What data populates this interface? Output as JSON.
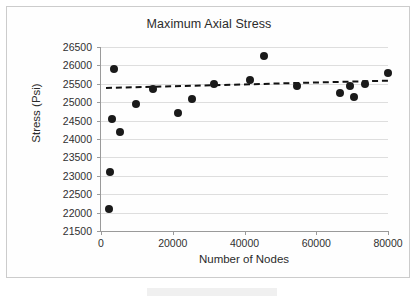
{
  "chart_data": {
    "type": "scatter",
    "title": "Maximum Axial Stress",
    "xlabel": "Number of Nodes",
    "ylabel": "Stress (Psi)",
    "xlim": [
      0,
      80000
    ],
    "ylim": [
      21500,
      26500
    ],
    "xticks": [
      0,
      20000,
      40000,
      60000,
      80000
    ],
    "xtick_labels": [
      "0",
      "20000",
      "40000",
      "60000",
      "80000"
    ],
    "yticks": [
      21500,
      22000,
      22500,
      23000,
      23500,
      24000,
      24500,
      25000,
      25500,
      26000,
      26500
    ],
    "ytick_labels": [
      "21500",
      "22000",
      "22500",
      "23000",
      "23500",
      "24000",
      "24500",
      "25000",
      "25500",
      "26000",
      "26500"
    ],
    "grid": true,
    "legend": "none",
    "series": [
      {
        "name": "Maximum Axial Stress",
        "marker": "circle",
        "color": "#1a1a1a",
        "points": [
          {
            "x": 2200,
            "y": 22100
          },
          {
            "x": 2600,
            "y": 23100
          },
          {
            "x": 3200,
            "y": 24550
          },
          {
            "x": 3600,
            "y": 25900
          },
          {
            "x": 5200,
            "y": 24200
          },
          {
            "x": 9800,
            "y": 24950
          },
          {
            "x": 14500,
            "y": 25350
          },
          {
            "x": 21500,
            "y": 24700
          },
          {
            "x": 25500,
            "y": 25100
          },
          {
            "x": 31500,
            "y": 25500
          },
          {
            "x": 41500,
            "y": 25600
          },
          {
            "x": 45500,
            "y": 26250
          },
          {
            "x": 54500,
            "y": 25450
          },
          {
            "x": 66500,
            "y": 25250
          },
          {
            "x": 69500,
            "y": 25450
          },
          {
            "x": 70500,
            "y": 25150
          },
          {
            "x": 73500,
            "y": 25500
          },
          {
            "x": 80000,
            "y": 25800
          }
        ]
      }
    ],
    "trendline": {
      "style": "dashed",
      "color": "#111111",
      "x_start": 1500,
      "y_start": 25420,
      "x_end": 80000,
      "y_end": 25620
    }
  }
}
